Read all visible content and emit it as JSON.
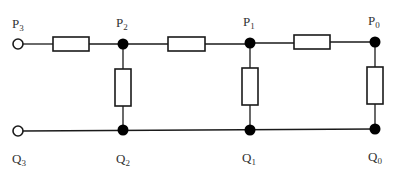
{
  "diagram": {
    "type": "ladder-network",
    "colors": {
      "line": "#1a1a1a",
      "node": "#000000",
      "label": "#333333",
      "background": "#ffffff"
    },
    "top_nodes": [
      {
        "id": "P3",
        "base": "P",
        "sub": "3",
        "kind": "open-terminal"
      },
      {
        "id": "P2",
        "base": "P",
        "sub": "2",
        "kind": "junction"
      },
      {
        "id": "P1",
        "base": "P",
        "sub": "1",
        "kind": "junction"
      },
      {
        "id": "P0",
        "base": "P",
        "sub": "0",
        "kind": "junction"
      }
    ],
    "bottom_nodes": [
      {
        "id": "Q3",
        "base": "Q",
        "sub": "3",
        "kind": "open-terminal"
      },
      {
        "id": "Q2",
        "base": "Q",
        "sub": "2",
        "kind": "junction"
      },
      {
        "id": "Q1",
        "base": "Q",
        "sub": "1",
        "kind": "junction"
      },
      {
        "id": "Q0",
        "base": "Q",
        "sub": "0",
        "kind": "junction"
      }
    ],
    "series_resistors": [
      {
        "from": "P3",
        "to": "P2"
      },
      {
        "from": "P2",
        "to": "P1"
      },
      {
        "from": "P1",
        "to": "P0"
      }
    ],
    "shunt_resistors": [
      {
        "from": "P2",
        "to": "Q2"
      },
      {
        "from": "P1",
        "to": "Q1"
      },
      {
        "from": "P0",
        "to": "Q0"
      }
    ]
  }
}
